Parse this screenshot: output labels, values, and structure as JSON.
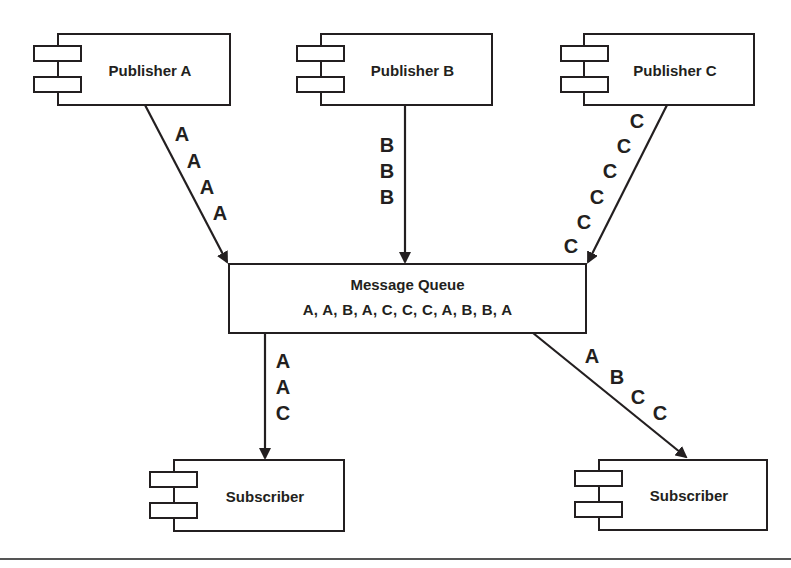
{
  "diagram": {
    "publishers": [
      {
        "label": "Publisher A",
        "messages": [
          "A",
          "A",
          "A",
          "A"
        ]
      },
      {
        "label": "Publisher B",
        "messages": [
          "B",
          "B",
          "B"
        ]
      },
      {
        "label": "Publisher C",
        "messages": [
          "C",
          "C",
          "C",
          "C",
          "C",
          "C"
        ]
      }
    ],
    "queue": {
      "title": "Message Queue",
      "sequence": "A, A, B, A, C, C, C, A, B, B, A"
    },
    "subscribers": [
      {
        "label": "Subscriber",
        "messages": [
          "A",
          "A",
          "C"
        ]
      },
      {
        "label": "Subscriber",
        "messages": [
          "A",
          "B",
          "C",
          "C"
        ]
      }
    ],
    "colors": {
      "stroke": "#231f20",
      "background": "#ffffff"
    }
  }
}
